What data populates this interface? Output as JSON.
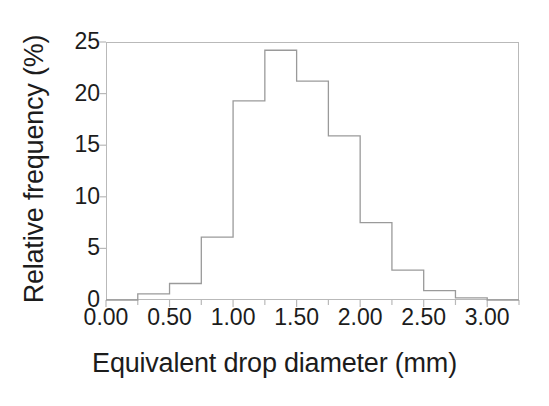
{
  "chart_data": {
    "type": "bar",
    "title": "",
    "subtitle": "",
    "xlabel": "Equivalent drop diameter (mm)",
    "ylabel": "Relative frequency (%)",
    "xlim": [
      0.0,
      3.25
    ],
    "ylim": [
      0,
      25
    ],
    "grid": false,
    "legend": null,
    "bin_width": 0.25,
    "bin_edges": [
      0.0,
      0.25,
      0.5,
      0.75,
      1.0,
      1.25,
      1.5,
      1.75,
      2.0,
      2.25,
      2.5,
      2.75,
      3.0,
      3.25
    ],
    "categories": [
      "0.00-0.25",
      "0.25-0.50",
      "0.50-0.75",
      "0.75-1.00",
      "1.00-1.25",
      "1.25-1.50",
      "1.50-1.75",
      "1.75-2.00",
      "2.00-2.25",
      "2.25-2.50",
      "2.50-2.75",
      "2.75-3.00",
      "3.00-3.25"
    ],
    "values": [
      0.0,
      0.6,
      1.6,
      6.1,
      19.3,
      24.2,
      21.2,
      15.9,
      7.5,
      2.9,
      0.9,
      0.2,
      0.0
    ],
    "xticks": [
      0.0,
      0.5,
      1.0,
      1.5,
      2.0,
      2.5,
      3.0
    ],
    "xtick_labels": [
      "0.00",
      "0.50",
      "1.00",
      "1.50",
      "2.00",
      "2.50",
      "3.00"
    ],
    "xminor_ticks": [
      0.25,
      0.75,
      1.25,
      1.75,
      2.25,
      2.75,
      3.25
    ],
    "yticks": [
      0,
      5,
      10,
      15,
      20,
      25
    ],
    "ytick_labels": [
      "0",
      "5",
      "10",
      "15",
      "20",
      "25"
    ],
    "line_color": "#9a9a9a",
    "frame_color": "#b9b9b9",
    "text_color": "#1c1c1c",
    "background": "#ffffff"
  }
}
